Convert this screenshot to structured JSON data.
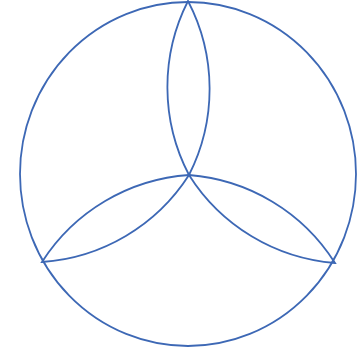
{
  "diagram": {
    "stroke_color": "#3d68b5",
    "stroke_width": 1.8,
    "background": "#ffffff",
    "outer_circle": {
      "cx": 188,
      "cy": 174,
      "rx": 168,
      "ry": 172
    },
    "center_point": {
      "x": 189,
      "y": 175
    },
    "vertices": [
      {
        "name": "top",
        "x": 188,
        "y": 1
      },
      {
        "name": "bottom-left",
        "x": 42,
        "y": 262
      },
      {
        "name": "bottom-right",
        "x": 335,
        "y": 263
      }
    ],
    "lens_arc_radius": 190,
    "lenses": [
      {
        "name": "top-lens",
        "from": "center",
        "to": "top"
      },
      {
        "name": "bottom-left-lens",
        "from": "center",
        "to": "bottom-left"
      },
      {
        "name": "bottom-right-lens",
        "from": "center",
        "to": "bottom-right"
      }
    ]
  }
}
